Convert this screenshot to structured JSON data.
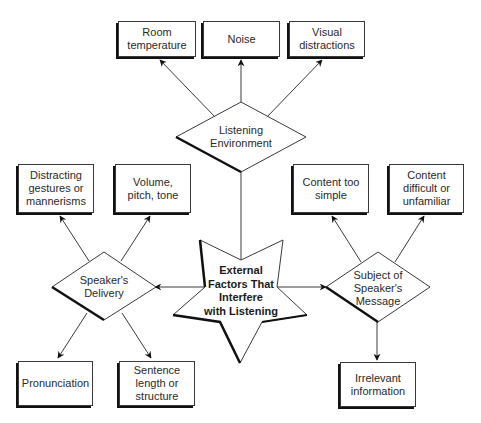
{
  "diagram": {
    "center": {
      "label": "External\nFactors That\nInterfere\nwith Listening"
    },
    "hubs": [
      {
        "id": "environment",
        "label": "Listening\nEnvironment",
        "factors": [
          "Room\ntemperature",
          "Noise",
          "Visual\ndistractions"
        ]
      },
      {
        "id": "delivery",
        "label": "Speaker's\nDelivery",
        "factors": [
          "Distracting\ngestures or\nmannerisms",
          "Volume,\npitch, tone",
          "Pronunciation",
          "Sentence\nlength or\nstructure"
        ]
      },
      {
        "id": "message",
        "label": "Subject of\nSpeaker's\nMessage",
        "factors": [
          "Content too\nsimple",
          "Content\ndifficult or\nunfamiliar",
          "Irrelevant\ninformation"
        ]
      }
    ]
  },
  "colors": {
    "line": "#3a3a3a",
    "shadow": "#111111",
    "text": "#2a2a2a",
    "background": "#ffffff"
  }
}
